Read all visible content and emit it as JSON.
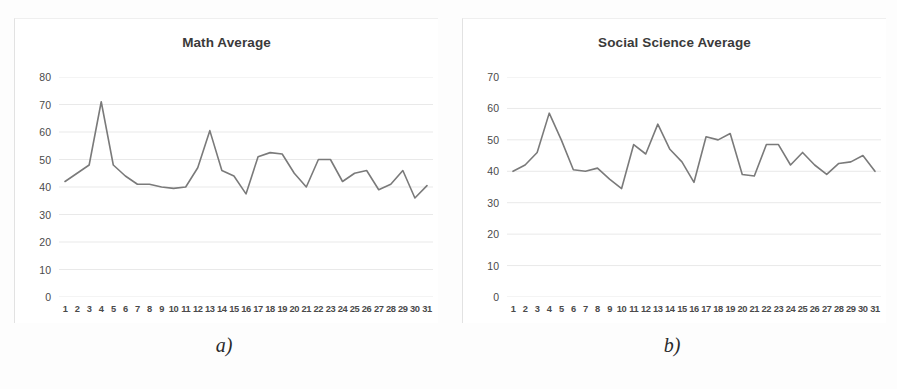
{
  "figure": {
    "background_color": "#fdfdfd",
    "line_color": "#7a7a7a",
    "grid_color": "#e9e9e9",
    "panels": [
      {
        "caption": "a)",
        "chart_data": {
          "type": "line",
          "title": "Math Average",
          "xlabel": "",
          "ylabel": "",
          "xlim": [
            1,
            31
          ],
          "ylim": [
            0,
            80
          ],
          "yticks": [
            80,
            70,
            60,
            50,
            40,
            30,
            20,
            10,
            0
          ],
          "grid": true,
          "legend": "none",
          "categories": [
            "1",
            "2",
            "3",
            "4",
            "5",
            "6",
            "7",
            "8",
            "9",
            "10",
            "11",
            "12",
            "13",
            "14",
            "15",
            "16",
            "17",
            "18",
            "19",
            "20",
            "21",
            "22",
            "23",
            "24",
            "25",
            "26",
            "27",
            "28",
            "29",
            "30",
            "31"
          ],
          "values": [
            42,
            45,
            48,
            71,
            48,
            44,
            41,
            41,
            40,
            39.5,
            40,
            47,
            60.5,
            46,
            44,
            37.5,
            51,
            52.5,
            52,
            45,
            40,
            50,
            50,
            42,
            45,
            46,
            39,
            41,
            46,
            36,
            40.5
          ]
        }
      },
      {
        "caption": "b)",
        "chart_data": {
          "type": "line",
          "title": "Social Science Average",
          "xlabel": "",
          "ylabel": "",
          "xlim": [
            1,
            31
          ],
          "ylim": [
            0,
            70
          ],
          "yticks": [
            70,
            60,
            50,
            40,
            30,
            20,
            10,
            0
          ],
          "grid": true,
          "legend": "none",
          "categories": [
            "1",
            "2",
            "3",
            "4",
            "5",
            "6",
            "7",
            "8",
            "9",
            "10",
            "11",
            "12",
            "13",
            "14",
            "15",
            "16",
            "17",
            "18",
            "19",
            "20",
            "21",
            "22",
            "23",
            "24",
            "25",
            "26",
            "27",
            "28",
            "29",
            "30",
            "31"
          ],
          "values": [
            40,
            42,
            46,
            58.5,
            50,
            40.5,
            40,
            41,
            37.5,
            34.5,
            48.5,
            45.5,
            55,
            47,
            43,
            36.5,
            51,
            50,
            52,
            39,
            38.5,
            48.5,
            48.5,
            42,
            46,
            42,
            39,
            42.5,
            43,
            45,
            40
          ]
        }
      }
    ]
  }
}
